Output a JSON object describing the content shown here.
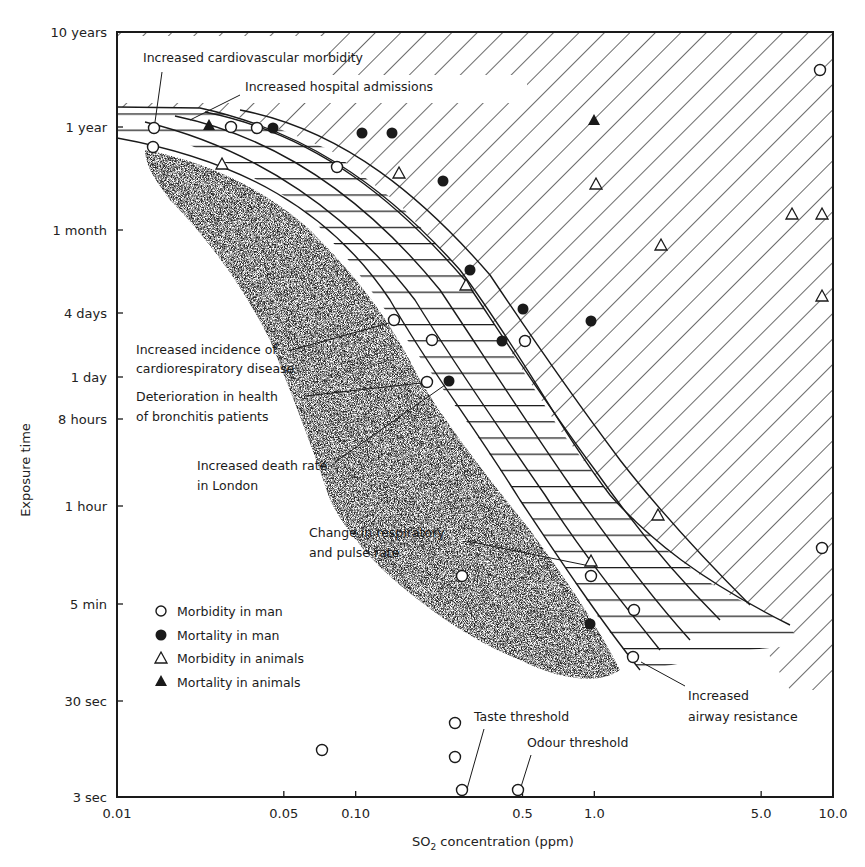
{
  "chart_data": {
    "type": "scatter",
    "title": "",
    "xlabel": "SO2 concentration (ppm)",
    "xlabel_main": "SO",
    "xlabel_sub": "2",
    "xlabel_rest": " concentration (ppm)",
    "ylabel": "Exposure time",
    "xscale": "log",
    "yscale": "log",
    "xlim": [
      0.01,
      10.0
    ],
    "ylim": [
      "3 sec",
      "10 years"
    ],
    "x_ticks": [
      {
        "label": "0.01",
        "value": 0.01
      },
      {
        "label": "0.05",
        "value": 0.05
      },
      {
        "label": "0.10",
        "value": 0.1
      },
      {
        "label": "0.5",
        "value": 0.5
      },
      {
        "label": "1.0",
        "value": 1.0
      },
      {
        "label": "5.0",
        "value": 5.0
      },
      {
        "label": "10.0",
        "value": 10.0
      }
    ],
    "y_ticks": [
      {
        "label": "10 years",
        "py": 32
      },
      {
        "label": "1 year",
        "py": 127
      },
      {
        "label": "1 month",
        "py": 230
      },
      {
        "label": "4 days",
        "py": 313
      },
      {
        "label": "1 day",
        "py": 377
      },
      {
        "label": "8 hours",
        "py": 419
      },
      {
        "label": "1 hour",
        "py": 506
      },
      {
        "label": "5 min",
        "py": 604
      },
      {
        "label": "30 sec",
        "py": 701
      },
      {
        "label": "3 sec",
        "py": 797
      }
    ],
    "grid": false,
    "legend": {
      "position": "lower-left inside",
      "entries": [
        {
          "marker": "open-circle",
          "label": "Morbidity in man"
        },
        {
          "marker": "filled-circle",
          "label": "Mortality in man"
        },
        {
          "marker": "open-triangle",
          "label": "Morbidity in animals"
        },
        {
          "marker": "filled-triangle",
          "label": "Mortality in animals"
        }
      ]
    },
    "series": [
      {
        "name": "Morbidity in man",
        "marker": "open-circle",
        "points": [
          {
            "x": 0.015,
            "y": "~1 year",
            "px": 154,
            "py": 128
          },
          {
            "x": 0.015,
            "y": "~7 months",
            "px": 153,
            "py": 147
          },
          {
            "x": 0.035,
            "y": "~1 year",
            "px": 231,
            "py": 127
          },
          {
            "x": 0.042,
            "y": "~1 year",
            "px": 257,
            "py": 128
          },
          {
            "x": 0.085,
            "y": "~4 months",
            "px": 337,
            "py": 167
          },
          {
            "x": 0.9,
            "y": "~3 years",
            "px": 820,
            "py": 70
          },
          {
            "x": 0.19,
            "y": "~3 days",
            "px": 394,
            "py": 320
          },
          {
            "x": 0.21,
            "y": "~2 days",
            "px": 432,
            "py": 340
          },
          {
            "x": 0.52,
            "y": "~2 days",
            "px": 525,
            "py": 341
          },
          {
            "x": 0.18,
            "y": "~20 hours",
            "px": 427,
            "py": 382
          },
          {
            "x": 9.5,
            "y": "~25 min",
            "px": 822,
            "py": 548
          },
          {
            "x": 0.98,
            "y": "~10 min",
            "px": 591,
            "py": 576
          },
          {
            "x": 1.5,
            "y": "~5 min",
            "px": 634,
            "py": 610
          },
          {
            "x": 0.27,
            "y": "~10 min",
            "px": 462,
            "py": 576
          },
          {
            "x": 1.45,
            "y": "~1.5 min",
            "px": 633,
            "py": 657
          },
          {
            "x": 0.2,
            "y": "~15 sec",
            "px": 455,
            "py": 723
          },
          {
            "x": 0.075,
            "y": "~8 sec",
            "px": 322,
            "py": 750
          },
          {
            "x": 0.2,
            "y": "~7 sec",
            "px": 455,
            "py": 757
          },
          {
            "x": 0.27,
            "y": "3 sec",
            "px": 462,
            "py": 790,
            "note": "Taste threshold"
          },
          {
            "x": 0.5,
            "y": "3 sec",
            "px": 518,
            "py": 790,
            "note": "Odour threshold"
          }
        ]
      },
      {
        "name": "Mortality in man",
        "marker": "filled-circle",
        "points": [
          {
            "x": 0.05,
            "y": "~1 year",
            "px": 273,
            "py": 128
          },
          {
            "x": 0.11,
            "y": "~11 months",
            "px": 362,
            "py": 133
          },
          {
            "x": 0.15,
            "y": "~11 months",
            "px": 392,
            "py": 133
          },
          {
            "x": 0.23,
            "y": "~3 months",
            "px": 443,
            "py": 181
          },
          {
            "x": 0.26,
            "y": "~9 days",
            "px": 470,
            "py": 270
          },
          {
            "x": 0.53,
            "y": "~4 days",
            "px": 523,
            "py": 309
          },
          {
            "x": 0.96,
            "y": "~3 days",
            "px": 591,
            "py": 321
          },
          {
            "x": 0.42,
            "y": "~2 days",
            "px": 502,
            "py": 341
          },
          {
            "x": 0.24,
            "y": "~20 hours",
            "px": 449,
            "py": 381
          },
          {
            "x": 0.98,
            "y": "~3 min",
            "px": 590,
            "py": 624
          }
        ]
      },
      {
        "name": "Morbidity in animals",
        "marker": "open-triangle",
        "points": [
          {
            "x": 0.026,
            "y": "~4 months",
            "px": 222,
            "py": 164
          },
          {
            "x": 0.16,
            "y": "~3 months",
            "px": 399,
            "py": 173
          },
          {
            "x": 1.05,
            "y": "~2.5 months",
            "px": 596,
            "py": 184
          },
          {
            "x": 0.25,
            "y": "~7 days",
            "px": 466,
            "py": 285
          },
          {
            "x": 2.0,
            "y": "~3 weeks",
            "px": 661,
            "py": 245
          },
          {
            "x": 6.5,
            "y": "~1.5 months",
            "px": 792,
            "py": 214
          },
          {
            "x": 9.5,
            "y": "~1.5 months",
            "px": 822,
            "py": 214
          },
          {
            "x": 9.5,
            "y": "~5 days",
            "px": 822,
            "py": 296
          },
          {
            "x": 1.75,
            "y": "~1 hour",
            "px": 658,
            "py": 515
          },
          {
            "x": 0.98,
            "y": "~15 min",
            "px": 591,
            "py": 561
          }
        ]
      },
      {
        "name": "Mortality in animals",
        "marker": "filled-triangle",
        "points": [
          {
            "x": 0.027,
            "y": "~1 year",
            "px": 209,
            "py": 125
          },
          {
            "x": 1.0,
            "y": "~1 year",
            "px": 594,
            "py": 120
          }
        ]
      }
    ],
    "regions": [
      {
        "name": "no-effect / threshold zone",
        "style": "stippled",
        "color": "#9a9a9a"
      },
      {
        "name": "transition band",
        "style": "cross-hatched"
      },
      {
        "name": "adverse effect zone",
        "style": "diagonal-hatched"
      }
    ],
    "annotations": [
      {
        "text": "Increased cardiovascular morbidity",
        "px": 143,
        "py": 62
      },
      {
        "text": "Increased hospital admissions",
        "px": 245,
        "py": 91
      },
      {
        "text": "Increased incidence of",
        "px": 136,
        "py": 354
      },
      {
        "text": "cardiorespiratory disease",
        "px": 136,
        "py": 373
      },
      {
        "text": "Deterioration in health",
        "px": 136,
        "py": 401
      },
      {
        "text": "of bronchitis patients",
        "px": 136,
        "py": 421
      },
      {
        "text": "Increased death rate",
        "px": 197,
        "py": 470
      },
      {
        "text": "in London",
        "px": 197,
        "py": 490
      },
      {
        "text": "Change in respiratory",
        "px": 309,
        "py": 537
      },
      {
        "text": "and pulse rate",
        "px": 309,
        "py": 557
      },
      {
        "text": "Taste threshold",
        "px": 474,
        "py": 721
      },
      {
        "text": "Odour threshold",
        "px": 527,
        "py": 747
      },
      {
        "text": "Increased",
        "px": 688,
        "py": 700
      },
      {
        "text": "airway resistance",
        "px": 688,
        "py": 721
      }
    ]
  }
}
